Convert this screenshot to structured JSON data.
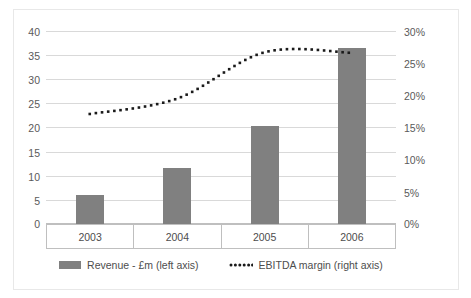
{
  "chart_data": {
    "type": "bar",
    "title": "",
    "subtitle": "",
    "xlabel": "",
    "ylabel": "",
    "categories": [
      "2003",
      "2004",
      "2005",
      "2006"
    ],
    "grid": true,
    "legend_position": "bottom",
    "axes": {
      "left": {
        "label": "Revenue - £m",
        "min": 0,
        "max": 40,
        "tick_step": 5,
        "ticks": [
          "0",
          "5",
          "10",
          "15",
          "20",
          "25",
          "30",
          "35",
          "40"
        ],
        "tick_values": [
          0,
          5,
          10,
          15,
          20,
          25,
          30,
          35,
          40
        ]
      },
      "right": {
        "label": "EBITDA margin",
        "min": 0,
        "max": 30,
        "tick_step": 5,
        "ticks": [
          "0%",
          "5%",
          "10%",
          "15%",
          "20%",
          "25%",
          "30%"
        ],
        "tick_values": [
          0,
          5,
          10,
          15,
          20,
          25,
          30
        ]
      }
    },
    "series": [
      {
        "name": "Revenue - £m (left axis)",
        "type": "bar",
        "axis": "left",
        "color": "#808080",
        "values": [
          6.0,
          11.6,
          20.3,
          36.5
        ]
      },
      {
        "name": "EBITDA margin (right axis)",
        "type": "line",
        "style": "dotted",
        "axis": "right",
        "color": "#1a1a1a",
        "values": [
          17.1,
          19.5,
          26.7,
          26.6
        ]
      }
    ]
  },
  "legend": {
    "items": [
      {
        "label": "Revenue - £m (left axis)",
        "marker": "bar-swatch"
      },
      {
        "label": "EBITDA margin (right axis)",
        "marker": "dotted-line"
      }
    ]
  }
}
